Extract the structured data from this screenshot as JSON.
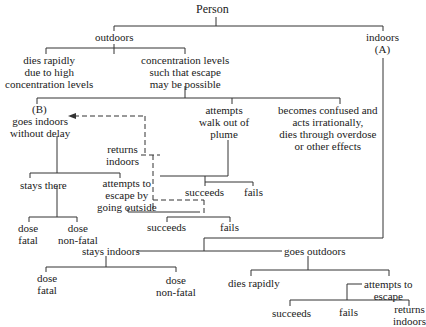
{
  "nodes": {
    "person": "Person",
    "outdoors": "outdoors",
    "indoors": "indoors",
    "indoors_mark": "(A)",
    "dies_rapidly_1": "dies rapidly",
    "dies_rapidly_2": "due to high",
    "dies_rapidly_3": "concentration levels",
    "conc_1": "concentration levels",
    "conc_2": "such that escape",
    "conc_3": "may be possible",
    "b_mark": "(B)",
    "goes_indoors_1": "goes indoors",
    "goes_indoors_2": "without delay",
    "walk_1": "attempts",
    "walk_2": "walk out of",
    "walk_3": "plume",
    "confused_1": "becomes confused and",
    "confused_2": "acts irrationally,",
    "confused_3": "dies through overdose",
    "confused_4": "or other effects",
    "returns_1": "returns",
    "returns_2": "indoors",
    "stays_there": "stays there",
    "escape_out_1": "attempts to",
    "escape_out_2": "escape by",
    "escape_out_3": "going outside",
    "walk_succeeds": "succeeds",
    "walk_fails": "fails",
    "dose_fatal_1a": "dose",
    "dose_fatal_1b": "fatal",
    "dose_nonfatal_1a": "dose",
    "dose_nonfatal_1b": "non-fatal",
    "out_succeeds": "succeeds",
    "out_fails": "fails",
    "stays_indoors": "stays indoors",
    "goes_outdoors": "goes outdoors",
    "dose_fatal_2a": "dose",
    "dose_fatal_2b": "fatal",
    "dose_nonfatal_2a": "dose",
    "dose_nonfatal_2b": "non-fatal",
    "dies_rapidly_b": "dies rapidly",
    "attempts_escape_1": "attempts to",
    "attempts_escape_2": "escape",
    "esc_succeeds": "succeeds",
    "esc_fails": "fails",
    "esc_returns_1": "returns",
    "esc_returns_2": "indoors"
  }
}
